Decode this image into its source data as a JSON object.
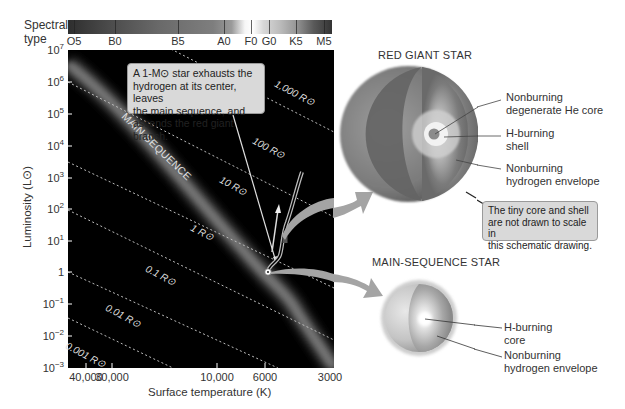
{
  "spectral": {
    "title_line1": "Spectral",
    "title_line2": "type",
    "classes": [
      {
        "label": "O5",
        "x": 74
      },
      {
        "label": "B0",
        "x": 115
      },
      {
        "label": "B5",
        "x": 178
      },
      {
        "label": "A0",
        "x": 224
      },
      {
        "label": "F0",
        "x": 251
      },
      {
        "label": "G0",
        "x": 269
      },
      {
        "label": "K5",
        "x": 296
      },
      {
        "label": "M5",
        "x": 324
      }
    ]
  },
  "y_axis": {
    "title": "Luminosity (L⊙)",
    "ticks": [
      {
        "base": "10",
        "exp": "7",
        "y": 50
      },
      {
        "base": "10",
        "exp": "6",
        "y": 82
      },
      {
        "base": "10",
        "exp": "5",
        "y": 114
      },
      {
        "base": "10",
        "exp": "4",
        "y": 146
      },
      {
        "base": "10",
        "exp": "3",
        "y": 178
      },
      {
        "base": "10",
        "exp": "2",
        "y": 209
      },
      {
        "base": "10",
        "exp": "1",
        "y": 241
      },
      {
        "base": "1",
        "exp": "",
        "y": 272
      },
      {
        "base": "10",
        "exp": "−1",
        "y": 304
      },
      {
        "base": "10",
        "exp": "−2",
        "y": 336
      },
      {
        "base": "10",
        "exp": "−3",
        "y": 368
      }
    ]
  },
  "x_axis": {
    "title": "Surface temperature (K)",
    "ticks": [
      {
        "label": "40,000",
        "x": 86
      },
      {
        "label": "30,000",
        "x": 112
      },
      {
        "label": "10,000",
        "x": 217
      },
      {
        "label": "6000",
        "x": 265
      },
      {
        "label": "3000",
        "x": 330
      }
    ]
  },
  "radius_lines": [
    {
      "label": "1,000 R⊙"
    },
    {
      "label": "100 R⊙"
    },
    {
      "label": "10 R⊙"
    },
    {
      "label": "1 R⊙"
    },
    {
      "label": "0.1 R⊙"
    },
    {
      "label": "0.01 R⊙"
    },
    {
      "label": "0.001 R⊙"
    }
  ],
  "main_sequence_label": "MAIN SEQUENCE",
  "callout_track": {
    "line1": "A 1-M⊙ star exhausts the",
    "line2": "hydrogen at its center, leaves",
    "line3": "the main sequence, and",
    "line4": "ascends the red giant branch."
  },
  "red_giant": {
    "title": "RED GIANT STAR",
    "labels": [
      {
        "line1": "Nonburning",
        "line2": "degenerate He core"
      },
      {
        "line1": "H-burning",
        "line2": "shell"
      },
      {
        "line1": "Nonburning",
        "line2": "hydrogen envelope"
      }
    ],
    "note": {
      "line1": "The tiny core and shell",
      "line2": "are not drawn to scale in",
      "line3": "this schematic drawing."
    }
  },
  "main_sequence_star": {
    "title": "MAIN-SEQUENCE STAR",
    "labels": [
      {
        "line1": "H-burning",
        "line2": "core"
      },
      {
        "line1": "Nonburning",
        "line2": "hydrogen envelope"
      }
    ]
  },
  "colors": {
    "plot_bg": "#000000",
    "main_sequence_band": "#6e6e6e",
    "callout_bg": "#d9d9d9",
    "arrow_gray": "#9c9c9c"
  }
}
